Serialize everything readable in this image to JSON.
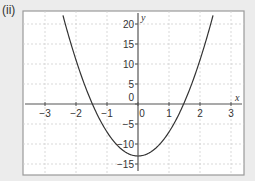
{
  "label": "(ii)",
  "chart_data": {
    "type": "line",
    "title": "",
    "xlabel": "x",
    "ylabel": "y",
    "xlim": [
      -3.5,
      3.4
    ],
    "ylim": [
      -17,
      22.5
    ],
    "xticks": [
      -3,
      -2,
      -1,
      0,
      1,
      2,
      3
    ],
    "yticks": [
      -15,
      -10,
      -5,
      0,
      5,
      10,
      15,
      20
    ],
    "xtick_labels": [
      "−3",
      "−2",
      "−1",
      "0",
      "1",
      "2",
      "3"
    ],
    "ytick_labels": [
      "−15",
      "−10",
      "−5",
      "0",
      "5",
      "10",
      "15",
      "20"
    ],
    "grid": true,
    "series": [
      {
        "name": "parabola",
        "equation_estimate": "y = 6x^2 - 13",
        "x": [
          -2.4,
          -2,
          -1.5,
          -1.47,
          -1,
          -0.5,
          0,
          0.5,
          1,
          1.47,
          1.5,
          2,
          2.4
        ],
        "y": [
          21.6,
          11,
          0.5,
          0,
          -7,
          -11.5,
          -13,
          -11.5,
          -7,
          0,
          0.5,
          11,
          21.6
        ]
      }
    ]
  },
  "colors": {
    "background": "#ececec",
    "plot_bg": "#ffffff",
    "frame": "#9a9a9a",
    "grid": "#cfcfcf",
    "axis": "#555555",
    "curve": "#333333",
    "text": "#333333"
  }
}
